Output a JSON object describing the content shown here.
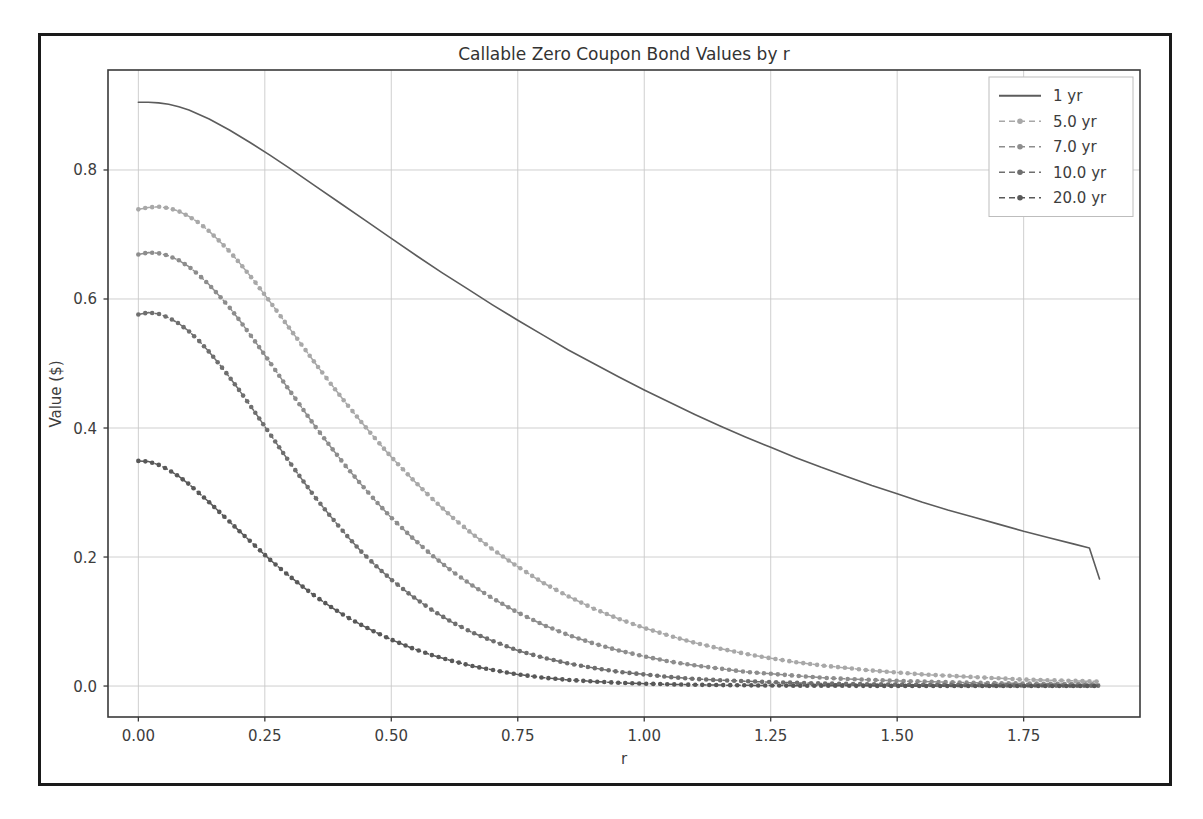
{
  "chart_data": {
    "type": "line",
    "title": "Callable Zero Coupon Bond Values by r",
    "xlabel": "r",
    "ylabel": "Value ($)",
    "xlim": [
      -0.06,
      1.98
    ],
    "ylim": [
      -0.048,
      0.955
    ],
    "xticks": [
      "0.00",
      "0.25",
      "0.50",
      "0.75",
      "1.00",
      "1.25",
      "1.50",
      "1.75"
    ],
    "xtick_values": [
      0.0,
      0.25,
      0.5,
      0.75,
      1.0,
      1.25,
      1.5,
      1.75
    ],
    "yticks": [
      "0.0",
      "0.2",
      "0.4",
      "0.6",
      "0.8"
    ],
    "ytick_values": [
      0.0,
      0.2,
      0.4,
      0.6,
      0.8
    ],
    "grid": true,
    "legend_position": "upper right",
    "series": [
      {
        "name": "1 yr",
        "color": "#5c5c5c",
        "linestyle": "solid",
        "marker": "none",
        "x": [
          0.0,
          0.02,
          0.04,
          0.06,
          0.08,
          0.1,
          0.14,
          0.18,
          0.22,
          0.26,
          0.3,
          0.35,
          0.4,
          0.45,
          0.5,
          0.55,
          0.6,
          0.65,
          0.7,
          0.75,
          0.8,
          0.85,
          0.9,
          0.95,
          1.0,
          1.05,
          1.1,
          1.15,
          1.2,
          1.25,
          1.3,
          1.35,
          1.4,
          1.45,
          1.5,
          1.55,
          1.6,
          1.65,
          1.7,
          1.75,
          1.8,
          1.85,
          1.88,
          1.9
        ],
        "y": [
          0.905,
          0.905,
          0.904,
          0.902,
          0.898,
          0.893,
          0.879,
          0.862,
          0.843,
          0.823,
          0.802,
          0.775,
          0.748,
          0.721,
          0.694,
          0.667,
          0.641,
          0.616,
          0.591,
          0.567,
          0.544,
          0.521,
          0.5,
          0.479,
          0.459,
          0.44,
          0.421,
          0.403,
          0.386,
          0.37,
          0.354,
          0.339,
          0.325,
          0.311,
          0.298,
          0.285,
          0.273,
          0.262,
          0.251,
          0.24,
          0.23,
          0.22,
          0.214,
          0.166
        ]
      },
      {
        "name": "5.0 yr",
        "color": "#a8a8a8",
        "linestyle": "dashed",
        "marker": "circle",
        "x": [
          0.0,
          0.02,
          0.04,
          0.06,
          0.08,
          0.1,
          0.12,
          0.14,
          0.16,
          0.18,
          0.2,
          0.23,
          0.26,
          0.29,
          0.32,
          0.35,
          0.38,
          0.41,
          0.44,
          0.47,
          0.5,
          0.54,
          0.58,
          0.62,
          0.66,
          0.7,
          0.75,
          0.8,
          0.85,
          0.9,
          0.95,
          1.0,
          1.05,
          1.1,
          1.15,
          1.2,
          1.25,
          1.3,
          1.35,
          1.4,
          1.45,
          1.5,
          1.55,
          1.6,
          1.65,
          1.7,
          1.75,
          1.8,
          1.85,
          1.9
        ],
        "y": [
          0.739,
          0.742,
          0.743,
          0.741,
          0.736,
          0.728,
          0.718,
          0.705,
          0.69,
          0.674,
          0.656,
          0.627,
          0.596,
          0.564,
          0.532,
          0.5,
          0.469,
          0.439,
          0.41,
          0.382,
          0.355,
          0.322,
          0.291,
          0.262,
          0.236,
          0.212,
          0.185,
          0.16,
          0.139,
          0.12,
          0.104,
          0.09,
          0.078,
          0.067,
          0.058,
          0.05,
          0.043,
          0.037,
          0.032,
          0.028,
          0.024,
          0.021,
          0.018,
          0.016,
          0.014,
          0.012,
          0.01,
          0.009,
          0.008,
          0.007
        ]
      },
      {
        "name": "7.0 yr",
        "color": "#8d8d8d",
        "linestyle": "dashed",
        "marker": "circle",
        "x": [
          0.0,
          0.02,
          0.04,
          0.06,
          0.08,
          0.1,
          0.12,
          0.14,
          0.16,
          0.18,
          0.2,
          0.23,
          0.26,
          0.29,
          0.32,
          0.35,
          0.38,
          0.41,
          0.44,
          0.47,
          0.5,
          0.54,
          0.58,
          0.62,
          0.66,
          0.7,
          0.75,
          0.8,
          0.85,
          0.9,
          0.95,
          1.0,
          1.05,
          1.1,
          1.15,
          1.2,
          1.25,
          1.3,
          1.35,
          1.4,
          1.45,
          1.5,
          1.55,
          1.6,
          1.65,
          1.7,
          1.75,
          1.8,
          1.85,
          1.9
        ],
        "y": [
          0.669,
          0.672,
          0.671,
          0.667,
          0.66,
          0.65,
          0.637,
          0.622,
          0.605,
          0.587,
          0.567,
          0.535,
          0.502,
          0.468,
          0.435,
          0.402,
          0.371,
          0.341,
          0.313,
          0.286,
          0.261,
          0.231,
          0.203,
          0.178,
          0.156,
          0.136,
          0.114,
          0.095,
          0.079,
          0.066,
          0.055,
          0.046,
          0.038,
          0.032,
          0.027,
          0.022,
          0.019,
          0.016,
          0.013,
          0.011,
          0.0095,
          0.008,
          0.007,
          0.006,
          0.005,
          0.0045,
          0.004,
          0.0035,
          0.003,
          0.0026
        ]
      },
      {
        "name": "10.0 yr",
        "color": "#6f6f6f",
        "linestyle": "dashed",
        "marker": "circle",
        "x": [
          0.0,
          0.02,
          0.04,
          0.06,
          0.08,
          0.1,
          0.12,
          0.14,
          0.16,
          0.18,
          0.2,
          0.23,
          0.26,
          0.29,
          0.32,
          0.35,
          0.38,
          0.41,
          0.44,
          0.47,
          0.5,
          0.54,
          0.58,
          0.62,
          0.66,
          0.7,
          0.75,
          0.8,
          0.85,
          0.9,
          0.95,
          1.0,
          1.05,
          1.1,
          1.15,
          1.2,
          1.25,
          1.3,
          1.35,
          1.4,
          1.45,
          1.5,
          1.55,
          1.6,
          1.65,
          1.7,
          1.75,
          1.8,
          1.85,
          1.9
        ],
        "y": [
          0.576,
          0.579,
          0.577,
          0.571,
          0.562,
          0.55,
          0.535,
          0.518,
          0.499,
          0.479,
          0.458,
          0.425,
          0.391,
          0.357,
          0.324,
          0.292,
          0.263,
          0.235,
          0.209,
          0.186,
          0.165,
          0.14,
          0.118,
          0.099,
          0.083,
          0.07,
          0.055,
          0.044,
          0.035,
          0.028,
          0.022,
          0.018,
          0.014,
          0.011,
          0.009,
          0.0075,
          0.006,
          0.005,
          0.004,
          0.0033,
          0.0027,
          0.0022,
          0.0018,
          0.0015,
          0.0012,
          0.001,
          0.0009,
          0.0007,
          0.0006,
          0.0005
        ]
      },
      {
        "name": "20.0 yr",
        "color": "#585858",
        "linestyle": "dashed",
        "marker": "circle",
        "x": [
          0.0,
          0.02,
          0.04,
          0.06,
          0.08,
          0.1,
          0.12,
          0.14,
          0.16,
          0.18,
          0.2,
          0.23,
          0.26,
          0.29,
          0.32,
          0.35,
          0.38,
          0.41,
          0.44,
          0.47,
          0.5,
          0.54,
          0.58,
          0.62,
          0.66,
          0.7,
          0.75,
          0.8,
          0.85,
          0.9,
          0.95,
          1.0,
          1.05,
          1.1,
          1.15,
          1.2,
          1.25,
          1.3,
          1.35,
          1.4,
          1.45,
          1.5,
          1.55,
          1.6,
          1.65,
          1.7,
          1.75,
          1.8,
          1.85,
          1.9
        ],
        "y": [
          0.349,
          0.348,
          0.343,
          0.335,
          0.325,
          0.313,
          0.299,
          0.285,
          0.27,
          0.255,
          0.24,
          0.218,
          0.196,
          0.176,
          0.157,
          0.139,
          0.123,
          0.108,
          0.095,
          0.083,
          0.072,
          0.059,
          0.048,
          0.039,
          0.031,
          0.025,
          0.018,
          0.013,
          0.0095,
          0.007,
          0.005,
          0.0037,
          0.0027,
          0.002,
          0.0015,
          0.0011,
          0.0008,
          0.0006,
          0.00045,
          0.00035,
          0.00026,
          0.0002,
          0.00015,
          0.00012,
          9e-05,
          7e-05,
          5e-05,
          4e-05,
          3e-05,
          2e-05
        ]
      }
    ]
  },
  "figure": {
    "background": "#ffffff",
    "border_color": "#1a1a1a",
    "grid_color": "#c9c9c9",
    "axis_color": "#3a3a3a"
  }
}
